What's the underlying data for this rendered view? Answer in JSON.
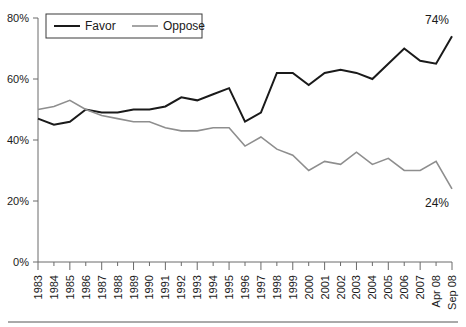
{
  "chart_data": {
    "type": "line",
    "title": "",
    "subtitle": "",
    "xlabel": "",
    "ylabel": "",
    "ylim": [
      0,
      80
    ],
    "ytick_labels": [
      "0%",
      "20%",
      "40%",
      "60%",
      "80%"
    ],
    "ytick_values": [
      0,
      20,
      40,
      60,
      80
    ],
    "grid": false,
    "legend_position": "top-left",
    "categories": [
      "1983",
      "1984",
      "1985",
      "1986",
      "1987",
      "1988",
      "1989",
      "1990",
      "1991",
      "1992",
      "1993",
      "1994",
      "1995",
      "1996",
      "1997",
      "1998",
      "1999",
      "2000",
      "2001",
      "2002",
      "2003",
      "2004",
      "2005",
      "2006",
      "2007",
      "Apr 08",
      "Sep 08"
    ],
    "series": [
      {
        "name": "Favor",
        "color": "#1a1a1a",
        "values": [
          47,
          45,
          46,
          50,
          49,
          49,
          50,
          50,
          51,
          54,
          53,
          55,
          57,
          46,
          49,
          62,
          62,
          58,
          62,
          63,
          62,
          60,
          65,
          70,
          66,
          65,
          74
        ],
        "end_label": "74%"
      },
      {
        "name": "Oppose",
        "color": "#8e8e8e",
        "values": [
          50,
          51,
          53,
          50,
          48,
          47,
          46,
          46,
          44,
          43,
          43,
          44,
          44,
          38,
          41,
          37,
          35,
          30,
          33,
          32,
          36,
          32,
          34,
          30,
          30,
          33,
          24
        ],
        "end_label": "24%"
      }
    ],
    "annotations": [
      {
        "text": "74%",
        "series": "Favor",
        "at": "Sep 08"
      },
      {
        "text": "24%",
        "series": "Oppose",
        "at": "Sep 08"
      }
    ]
  },
  "legend": {
    "items": [
      {
        "label": "Favor",
        "color": "#1a1a1a"
      },
      {
        "label": "Oppose",
        "color": "#8e8e8e"
      }
    ]
  }
}
